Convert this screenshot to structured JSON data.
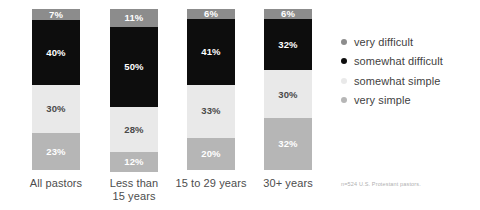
{
  "chart_data": {
    "type": "bar",
    "subtype": "stacked-100-percent",
    "title": "",
    "subtitle": "",
    "xlabel": "",
    "ylabel": "",
    "ylim": [
      0,
      100
    ],
    "grid": false,
    "legend_position": "right",
    "orientation": "vertical",
    "categories": [
      "All pastors",
      "Less than 15 years",
      "15 to 29 years",
      "30+ years"
    ],
    "category_label_lines": [
      [
        "All pastors"
      ],
      [
        "Less than",
        "15 years"
      ],
      [
        "15 to 29 years"
      ],
      [
        "30+ years"
      ]
    ],
    "series": [
      {
        "name": "very difficult",
        "color": "#8c8c8c",
        "values": [
          7,
          11,
          6,
          6
        ],
        "labels": [
          "7%",
          "11%",
          "6%",
          "6%"
        ]
      },
      {
        "name": "somewhat difficult",
        "color": "#0d0d0d",
        "values": [
          40,
          50,
          41,
          32
        ],
        "labels": [
          "40%",
          "50%",
          "41%",
          "32%"
        ]
      },
      {
        "name": "somewhat simple",
        "color": "#e9e9e9",
        "values": [
          30,
          28,
          33,
          30
        ],
        "labels": [
          "30%",
          "28%",
          "33%",
          "30%"
        ]
      },
      {
        "name": "very simple",
        "color": "#b6b6b6",
        "values": [
          23,
          12,
          20,
          32
        ],
        "labels": [
          "23%",
          "12%",
          "20%",
          "32%"
        ]
      }
    ],
    "annotations": [
      "n=524 U.S. Protestant pastors."
    ]
  },
  "legend": {
    "items": [
      {
        "label": "very difficult",
        "color": "#8c8c8c"
      },
      {
        "label": "somewhat difficult",
        "color": "#0d0d0d"
      },
      {
        "label": "somewhat simple",
        "color": "#e9e9e9"
      },
      {
        "label": "very simple",
        "color": "#b6b6b6"
      }
    ]
  },
  "footnote": {
    "text": "n=524 U.S. Protestant pastors."
  },
  "bars": [
    {
      "category_lines": [
        "All pastors"
      ],
      "segments": [
        {
          "series": "very difficult",
          "value": 7,
          "label": "7%"
        },
        {
          "series": "somewhat difficult",
          "value": 40,
          "label": "40%"
        },
        {
          "series": "somewhat simple",
          "value": 30,
          "label": "30%"
        },
        {
          "series": "very simple",
          "value": 23,
          "label": "23%"
        }
      ]
    },
    {
      "category_lines": [
        "Less than",
        "15 years"
      ],
      "segments": [
        {
          "series": "very difficult",
          "value": 11,
          "label": "11%"
        },
        {
          "series": "somewhat difficult",
          "value": 50,
          "label": "50%"
        },
        {
          "series": "somewhat simple",
          "value": 28,
          "label": "28%"
        },
        {
          "series": "very simple",
          "value": 12,
          "label": "12%"
        }
      ]
    },
    {
      "category_lines": [
        "15 to 29 years"
      ],
      "segments": [
        {
          "series": "very difficult",
          "value": 6,
          "label": "6%"
        },
        {
          "series": "somewhat difficult",
          "value": 41,
          "label": "41%"
        },
        {
          "series": "somewhat simple",
          "value": 33,
          "label": "33%"
        },
        {
          "series": "very simple",
          "value": 20,
          "label": "20%"
        }
      ]
    },
    {
      "category_lines": [
        "30+ years"
      ],
      "segments": [
        {
          "series": "very difficult",
          "value": 6,
          "label": "6%"
        },
        {
          "series": "somewhat difficult",
          "value": 32,
          "label": "32%"
        },
        {
          "series": "somewhat simple",
          "value": 30,
          "label": "30%"
        },
        {
          "series": "very simple",
          "value": 32,
          "label": "32%"
        }
      ]
    }
  ]
}
